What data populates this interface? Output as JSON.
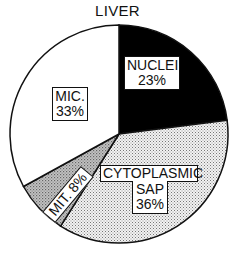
{
  "chart_data": {
    "type": "pie",
    "title": "LIVER",
    "categories": [
      "NUCLEI",
      "CYTOPLASMIC SAP",
      "MIT.",
      "MIC."
    ],
    "values": [
      23,
      36,
      8,
      33
    ],
    "unit": "%",
    "slices": [
      {
        "label": "NUCLEI",
        "value": 23,
        "fill": "solid-black",
        "color": "#000000"
      },
      {
        "label": "CYTOPLASMIC SAP",
        "value": 36,
        "fill": "fine-stipple",
        "color": "#d9d9d9"
      },
      {
        "label": "MIT.",
        "value": 8,
        "fill": "dense-stipple",
        "color": "#a8a8a8"
      },
      {
        "label": "MIC.",
        "value": 33,
        "fill": "white",
        "color": "#ffffff"
      }
    ],
    "start_angle": "12 o'clock, clockwise",
    "legend": "none (labels inside slices)"
  },
  "labels": {
    "title": "LIVER",
    "nuclei_name": "NUCLEI",
    "nuclei_pct": "23%",
    "cyto_name_1": "CYTOPLASMIC",
    "cyto_name_2": "SAP",
    "cyto_pct": "36%",
    "mit": "MIT. 8%",
    "mic_name": "MIC.",
    "mic_pct": "33%"
  }
}
